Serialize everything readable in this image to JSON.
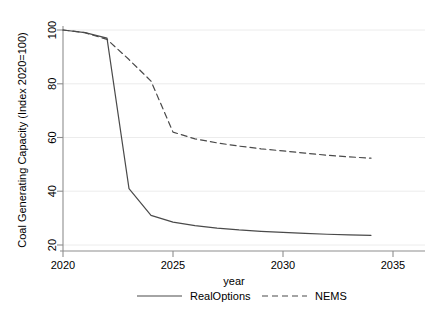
{
  "chart_data": {
    "type": "line",
    "title": "",
    "xlabel": "year",
    "ylabel": "Coal Generating Capacity (Index 2020=100)",
    "xlim": [
      2020,
      2035
    ],
    "ylim": [
      20,
      100
    ],
    "xticks": [
      2020,
      2025,
      2030,
      2035
    ],
    "yticks": [
      20,
      40,
      60,
      80,
      100
    ],
    "grid": true,
    "grid_axis": "y",
    "legend_position": "bottom",
    "x": [
      2020,
      2021,
      2022,
      2023,
      2024,
      2025,
      2026,
      2027,
      2028,
      2029,
      2030,
      2031,
      2032,
      2033,
      2034
    ],
    "series": [
      {
        "name": "RealOptions",
        "style": "solid",
        "color": "#4a4a4a",
        "values": [
          100,
          99,
          97,
          41,
          31,
          28.5,
          27.2,
          26.3,
          25.6,
          25.1,
          24.7,
          24.3,
          24.0,
          23.8,
          23.6
        ]
      },
      {
        "name": "NEMS",
        "style": "dashed",
        "color": "#4a4a4a",
        "values": [
          100,
          99,
          96.5,
          89,
          81,
          62,
          59.5,
          58,
          56.8,
          55.8,
          55.0,
          54.2,
          53.4,
          52.8,
          52.3
        ]
      }
    ]
  },
  "axes": {
    "y_title": "Coal Generating Capacity (Index 2020=100)",
    "x_title": "year",
    "y_tick_labels": [
      "20",
      "40",
      "60",
      "80",
      "100"
    ],
    "x_tick_labels": [
      "2020",
      "2025",
      "2030",
      "2035"
    ]
  },
  "legend": {
    "entries": [
      {
        "label": "RealOptions",
        "style": "solid"
      },
      {
        "label": "NEMS",
        "style": "dashed"
      }
    ]
  },
  "colors": {
    "line": "#4a4a4a",
    "axis": "#8a8a8a",
    "grid": "#e8e8e8",
    "background": "#ffffff"
  }
}
